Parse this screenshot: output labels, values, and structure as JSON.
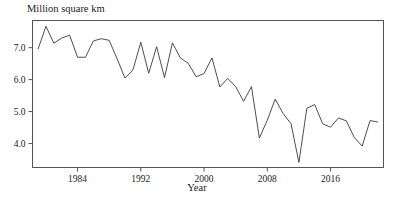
{
  "chart_data": {
    "type": "line",
    "title": "",
    "ylabel": "Million square km",
    "xlabel": "Year",
    "grid": false,
    "legend": null,
    "xlim": [
      1978.3,
      2022.7
    ],
    "ylim": [
      3.25,
      7.85
    ],
    "xticks": [
      1984,
      1992,
      2000,
      2008,
      2016
    ],
    "xticklabels": [
      "1984",
      "1992",
      "2000",
      "2008",
      "2016"
    ],
    "yticks": [
      4.0,
      5.0,
      6.0,
      7.0
    ],
    "yticklabels": [
      "4.0",
      "5.0",
      "6.0",
      "7.0"
    ],
    "line_color": "#3a3a3a",
    "series": [
      {
        "name": "Minimum sea ice extent",
        "x": [
          1979,
          1980,
          1981,
          1982,
          1983,
          1984,
          1985,
          1986,
          1987,
          1988,
          1989,
          1990,
          1991,
          1992,
          1993,
          1994,
          1995,
          1996,
          1997,
          1998,
          1999,
          2000,
          2001,
          2002,
          2003,
          2004,
          2005,
          2006,
          2007,
          2008,
          2009,
          2010,
          2011,
          2012,
          2013,
          2014,
          2015,
          2016,
          2017,
          2018,
          2019,
          2020,
          2021,
          2022
        ],
        "values": [
          6.95,
          7.67,
          7.14,
          7.3,
          7.39,
          6.7,
          6.7,
          7.21,
          7.28,
          7.23,
          6.65,
          6.05,
          6.3,
          7.17,
          6.2,
          7.03,
          6.06,
          7.15,
          6.68,
          6.51,
          6.09,
          6.19,
          6.68,
          5.77,
          6.04,
          5.78,
          5.32,
          5.78,
          4.17,
          4.73,
          5.39,
          4.94,
          4.62,
          3.41,
          5.1,
          5.22,
          4.62,
          4.51,
          4.8,
          4.71,
          4.19,
          3.92,
          4.72,
          4.67
        ]
      }
    ],
    "annotations": []
  },
  "axes": {
    "y_axis_title": "Million square km",
    "x_axis_title": "Year"
  }
}
